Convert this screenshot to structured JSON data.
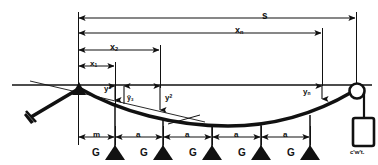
{
  "figure": {
    "background_color": "#ffffff",
    "ink_color": "#111111"
  },
  "dimensions": {
    "span_total": {
      "label": "s",
      "name": "total-span"
    },
    "span_xn": {
      "label": "x",
      "sub": "n",
      "name": "distance-xn"
    },
    "span_x2": {
      "label": "x",
      "sub": "2",
      "name": "distance-x2"
    },
    "span_x1": {
      "label": "x",
      "sub": "1",
      "name": "distance-x1"
    },
    "offset_m": {
      "label": "m",
      "name": "offset-m"
    },
    "spacing": {
      "label": "a",
      "name": "load-spacing"
    },
    "spacing_repeat_count": 4
  },
  "sags": [
    {
      "label": "y",
      "sup": "1",
      "name": "sag-y1"
    },
    {
      "label": "ȳ",
      "sub": "3",
      "name": "sag-y3"
    },
    {
      "label": "y",
      "sup": "2",
      "name": "sag-y2"
    },
    {
      "label": "y",
      "sub": "n",
      "name": "sag-yn"
    }
  ],
  "loads": {
    "label": "G",
    "count": 5,
    "name": "point-load"
  },
  "counterweight": {
    "label": "c'w't.",
    "name": "counterweight"
  },
  "components": {
    "datum_line": "reference-datum-line",
    "cable": "catenary-cable",
    "anchor_strut": "left-anchor-strut",
    "pulley": "right-pulley",
    "hanger_rod": "load-hanger-rod"
  }
}
